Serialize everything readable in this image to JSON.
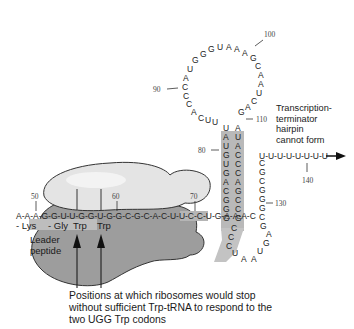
{
  "diagram": {
    "colors": {
      "ribosome_large": "#9a9a9a",
      "ribosome_small": "#e6e6e6",
      "highlight_band": "#b9b9b9",
      "text": "#1a1a1a",
      "background": "#ffffff"
    },
    "mrna_leader": {
      "sequence": "A-A-A-G-G-U-U-G-G-U-G-G-C-G-C-A-C-U-U-C-C-U-G-A-A-A-C",
      "markers": [
        {
          "label": "50",
          "position": "A"
        },
        {
          "label": "60",
          "position": "C"
        },
        {
          "label": "70",
          "position": "G"
        }
      ]
    },
    "peptide": {
      "residues": [
        "- Lys",
        "- Gly",
        "Trp",
        "Trp"
      ],
      "label_line1": "Leader",
      "label_line2": "peptide"
    },
    "loop": {
      "sequence_left": [
        "C",
        "A",
        "C",
        "C",
        "A",
        "U",
        "G",
        "G"
      ],
      "sequence_top": [
        "G",
        "U",
        "A",
        "A",
        "A",
        "G"
      ],
      "sequence_right": [
        "C",
        "A",
        "A",
        "U",
        "C",
        "A",
        "G"
      ],
      "markers": [
        {
          "label": "90"
        },
        {
          "label": "100"
        }
      ]
    },
    "stem": {
      "left_strand": [
        "U",
        "A",
        "U",
        "G",
        "U",
        "G",
        "A",
        "C",
        "G",
        "G",
        "G"
      ],
      "right_strand": [
        "A",
        "U",
        "A",
        "C",
        "C",
        "C",
        "A",
        "G",
        "C",
        "C",
        "G"
      ],
      "markers": [
        {
          "label": "80"
        },
        {
          "label": "110"
        }
      ]
    },
    "terminator_region": {
      "strand": [
        "C",
        "G",
        "G",
        "G",
        "C",
        "G",
        "A",
        "G",
        "U",
        "A",
        "A",
        "U",
        "C"
      ],
      "polyU": "U-U-U-U-U-U-U-U",
      "markers": [
        {
          "label": "130"
        },
        {
          "label": "140"
        }
      ],
      "label_lines": [
        "Transcription-",
        "terminator",
        "hairpin",
        "cannot form"
      ]
    },
    "caption": {
      "lines": [
        "Positions at which ribosomes would stop",
        "without sufficient Trp-tRNA to respond to the",
        "two UGG Trp codons"
      ]
    }
  }
}
